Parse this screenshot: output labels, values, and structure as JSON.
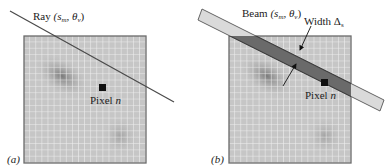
{
  "panels": [
    {
      "id": "a",
      "tag": "(a)",
      "line_label_main": "Ray ",
      "line_label_params": "(s",
      "line_label_sub_m": "m",
      "line_label_comma": ", θ",
      "line_label_sub_v": "v",
      "line_label_close": ")",
      "pixel_label": "Pixel ",
      "pixel_var": "n"
    },
    {
      "id": "b",
      "tag": "(b)",
      "line_label_main": "Beam ",
      "line_label_params": "(s",
      "line_label_sub_m": "m",
      "line_label_comma": ", θ",
      "line_label_sub_v": "v",
      "line_label_close": ")",
      "width_label": "Width Δ",
      "width_sub": "s",
      "pixel_label": "Pixel ",
      "pixel_var": "n"
    }
  ],
  "colors": {
    "grid_fill": "#c4c4c4",
    "grid_line": "#f2f2f2",
    "grid_border": "#6e6e6e",
    "blob_dark": "#7a7a7a",
    "ray": "#4a4a4a",
    "beam_outside": "#dcdcdc",
    "beam_inside": "#6a6a6a",
    "pixel": "#111111"
  }
}
